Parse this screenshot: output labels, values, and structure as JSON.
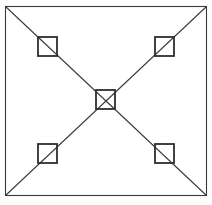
{
  "diagram": {
    "type": "geometric-line-drawing",
    "colors": {
      "background": "#ffffff",
      "stroke": "#3a3a3a",
      "node_stroke": "#2e2e2e"
    },
    "outer_square": {
      "x": 5,
      "y": 6,
      "width": 201,
      "height": 189
    },
    "diagonals": [
      {
        "name": "top-left-to-bottom-right",
        "x1": 5,
        "y1": 6,
        "x2": 206,
        "y2": 195
      },
      {
        "name": "top-right-to-bottom-left",
        "x1": 206,
        "y1": 6,
        "x2": 5,
        "y2": 195
      }
    ],
    "nodes": [
      {
        "name": "top-left",
        "x": 38,
        "y": 37,
        "size": 19
      },
      {
        "name": "top-right",
        "x": 155,
        "y": 37,
        "size": 19
      },
      {
        "name": "center",
        "x": 96,
        "y": 90,
        "size": 19
      },
      {
        "name": "bottom-left",
        "x": 38,
        "y": 144,
        "size": 19
      },
      {
        "name": "bottom-right",
        "x": 155,
        "y": 144,
        "size": 19
      }
    ]
  }
}
